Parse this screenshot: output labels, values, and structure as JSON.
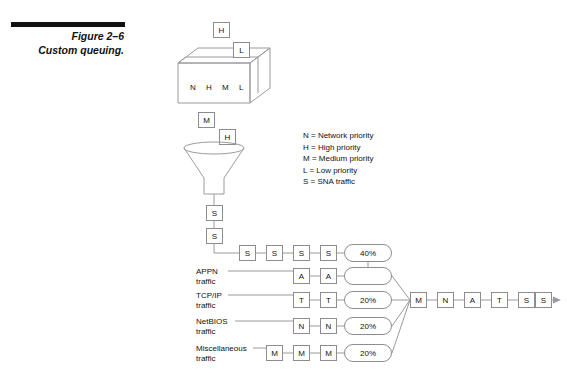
{
  "page": {
    "faint_header": "",
    "figure_number": "Figure 2–6",
    "figure_title": "Custom queuing."
  },
  "box3d": {
    "contents": [
      "N",
      "H",
      "M",
      "L"
    ],
    "above_boxes": [
      {
        "label": "H"
      },
      {
        "label": "L"
      }
    ]
  },
  "funnel": {
    "above_boxes": [
      {
        "label": "M"
      },
      {
        "label": "H"
      }
    ],
    "stem_boxes": [
      {
        "label": "S"
      },
      {
        "label": "S"
      }
    ]
  },
  "legend": {
    "entries": [
      "N = Network priority",
      "H = High priority",
      "M = Medium priority",
      "L = Low priority",
      "S = SNA traffic"
    ]
  },
  "queues": [
    {
      "label_line1": "",
      "label_line2": "",
      "packets": [
        "S",
        "S",
        "S",
        "S"
      ],
      "allocation": "40%"
    },
    {
      "label_line1": "APPN",
      "label_line2": "traffic",
      "packets": [
        "A",
        "A"
      ],
      "allocation": ""
    },
    {
      "label_line1": "TCP/IP",
      "label_line2": "traffic",
      "packets": [
        "T",
        "T"
      ],
      "allocation": "20%"
    },
    {
      "label_line1": "NetBIOS",
      "label_line2": "traffic",
      "packets": [
        "N",
        "N"
      ],
      "allocation": "20%"
    },
    {
      "label_line1": "Miscellaneous",
      "label_line2": "traffic",
      "packets": [
        "M",
        "M",
        "M"
      ],
      "allocation": "20%"
    }
  ],
  "output_chain": {
    "packets": [
      "M",
      "N",
      "A",
      "T",
      "S",
      "S"
    ]
  },
  "colors": {
    "line": "#9a9aa0",
    "box_border": "#8c8c92",
    "text": "#111111",
    "rule": "#111111"
  }
}
